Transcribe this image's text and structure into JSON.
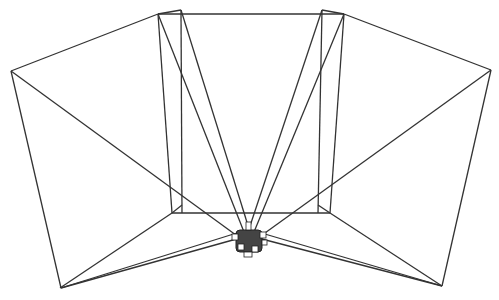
{
  "figure": {
    "stroke_color": "#333333",
    "background": "#ffffff"
  },
  "geometry": {
    "hub": {
      "cx": 248,
      "cy": 240
    },
    "outer_left": [
      [
        11,
        71
      ],
      [
        158,
        14
      ],
      [
        172,
        213
      ],
      [
        61,
        288
      ]
    ],
    "outer_right": [
      [
        491,
        70
      ],
      [
        344,
        14
      ],
      [
        330,
        213
      ],
      [
        442,
        286
      ]
    ],
    "top_edge": [
      [
        158,
        14
      ],
      [
        344,
        14
      ]
    ],
    "inner_box_bottom": [
      [
        182,
        213
      ],
      [
        318,
        213
      ]
    ]
  }
}
